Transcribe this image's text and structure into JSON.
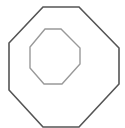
{
  "diagram": {
    "width": 125,
    "height": 128,
    "shapes": [
      {
        "name": "outer-octagon",
        "points": "43,7 79,7 119,48 119,84 79,127 43,127 9,90 9,43",
        "stroke": "#555555",
        "stroke_width": 1.6
      },
      {
        "name": "inner-octagon",
        "points": "45,29 61,29 80,48 80,64 62,84 44,84 30,68 30,47",
        "stroke": "#999999",
        "stroke_width": 1.4
      }
    ]
  }
}
